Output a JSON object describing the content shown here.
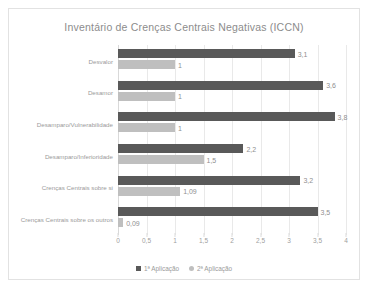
{
  "chart_data": {
    "type": "bar",
    "orientation": "horizontal",
    "title": "Inventário de Crenças Centrais Negativas (ICCN)",
    "xlabel": "",
    "ylabel": "",
    "xlim": [
      0,
      4
    ],
    "xticks": [
      "0",
      "0,5",
      "1",
      "1,5",
      "2",
      "2,5",
      "3",
      "3,5",
      "4"
    ],
    "xtick_values": [
      0,
      0.5,
      1,
      1.5,
      2,
      2.5,
      3,
      3.5,
      4
    ],
    "grid": true,
    "legend_position": "bottom",
    "categories": [
      "Desvalor",
      "Desamor",
      "Desamparo/Vulnerabilidade",
      "Desamparo/Inferioridade",
      "Crenças Centrais sobre si",
      "Crenças Centrais sobre os outros"
    ],
    "series": [
      {
        "name": "1ª Aplicação",
        "color": "#595959",
        "values": [
          3.1,
          3.6,
          3.8,
          2.2,
          3.2,
          3.5
        ],
        "labels": [
          "3,1",
          "3,6",
          "3,8",
          "2,2",
          "3,2",
          "3,5"
        ]
      },
      {
        "name": "2ª Aplicação",
        "color": "#bfbfbf",
        "values": [
          1,
          1,
          1,
          1.5,
          1.09,
          0.09
        ],
        "labels": [
          "1",
          "1",
          "1",
          "1,5",
          "1,09",
          "0,09"
        ]
      }
    ]
  }
}
